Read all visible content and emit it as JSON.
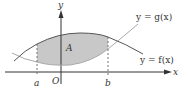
{
  "diagram": {
    "colors": {
      "background": "#ffffff",
      "axis": "#333333",
      "curve_f": "#555555",
      "curve_g": "#aaaaaa",
      "shaded_region": "#c8c8c8",
      "dashed": "#666666",
      "text": "#333333"
    },
    "axes": {
      "x_label": "x",
      "y_label": "y",
      "origin_label": "O"
    },
    "bounds": {
      "a_label": "a",
      "b_label": "b"
    },
    "region_label": "A",
    "curves": {
      "f": {
        "label": "y = f(x)",
        "role": "upper curve"
      },
      "g": {
        "label": "y = g(x)",
        "role": "lower curve"
      }
    }
  }
}
